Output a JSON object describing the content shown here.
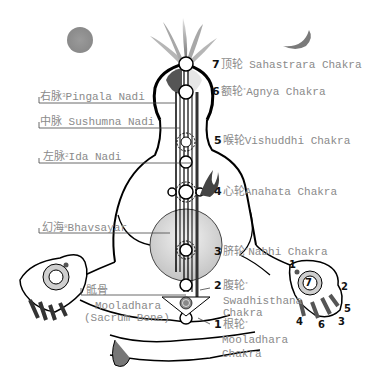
{
  "diagram": {
    "symbols": {
      "sun": "sun-disc",
      "moon": "crescent-moon",
      "crown": "lotus-flame"
    },
    "colors": {
      "label_text": "#8a8a8a",
      "number_text": "#111111",
      "line": "#000000",
      "sun": "#8f8f8f",
      "moon": "#7a7a7a"
    }
  },
  "nadis": [
    {
      "cn": "右脉",
      "sup": "3",
      "en": "Pingala Nadi"
    },
    {
      "cn": "中脉",
      "sup": "",
      "en": "Sushumna Nadi"
    },
    {
      "cn": "左脉",
      "sup": "2",
      "en": "Ida Nadi"
    }
  ],
  "bhavsayar": {
    "cn": "幻海",
    "sup": "8",
    "en": "Bhavsayar"
  },
  "sacrum": {
    "cn": "骶骨",
    "en_line1": "Mooladhara",
    "en_line2": "(Sacrum Bone)"
  },
  "chakras": [
    {
      "num": "7",
      "cn": "顶轮",
      "sup": "",
      "en": "Sahastrara Chakra"
    },
    {
      "num": "6",
      "cn": "额轮",
      "sup": "*",
      "en": "Agnya Chakra"
    },
    {
      "num": "5",
      "cn": "喉轮",
      "sup": "",
      "en": "Vishuddhi Chakra"
    },
    {
      "num": "4",
      "cn": "心轮",
      "sup": "",
      "en": "Anahata Chakra"
    },
    {
      "num": "3",
      "cn": "脐轮",
      "sup": "*",
      "en": "Nabhi Chakra"
    },
    {
      "num": "2",
      "cn": "腹轮",
      "sup": "*",
      "en_line1": "Swadhisthana",
      "en_line2": "Chakra"
    },
    {
      "num": "1",
      "cn": "根轮",
      "sup": "*",
      "en_line1": "Mooladhara",
      "en_line2": "Chakra"
    }
  ],
  "hand_numbers": {
    "palm": "7",
    "f1": "1",
    "f2": "2",
    "f3": "3",
    "f4": "4",
    "f5": "5",
    "f6": "6"
  }
}
